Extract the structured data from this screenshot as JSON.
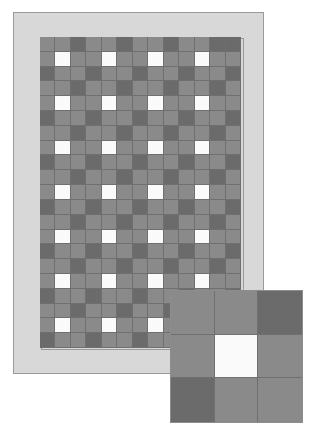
{
  "figure": {
    "kind": "quilt-pattern-diagram",
    "title": ""
  },
  "palette": {
    "border_fill": "#d8d8d8",
    "border_stroke": "#9a9a9a",
    "patch_mid": "#8a8a8a",
    "patch_dark": "#6b6b6b",
    "patch_light": "#fafafa",
    "seam_line": "#6f6f6f",
    "background": "#ffffff"
  },
  "quilt": {
    "name": "main-quilt",
    "columns": 13,
    "rows": 21,
    "border_width_px": 13,
    "cell_codes_legend": {
      "m": "mid-gray patch",
      "d": "dark-gray patch",
      "l": "light/white patch"
    },
    "grid": [
      "mmdmmdmmdmmdd",
      "mlmmlmmlmmlmm",
      "dmmdmmdmmdmmd",
      "mmdmmdmmdmmdm",
      "mlmmlmmlmmlmm",
      "dmmdmmdmmdmmd",
      "mmdmmdmmdmmdm",
      "mlmmlmmlmmlmm",
      "dmmdmmdmmdmmd",
      "mmdmmdmmdmmdm",
      "mlmmlmmlmmlmm",
      "dmmdmmdmmdmmd",
      "mmdmmdmmdmmdm",
      "mlmmlmmlmmlmm",
      "dmmdmmdmmdmmd",
      "mmdmmdmmdmmdm",
      "mlmmlmmlmmlmm",
      "dmmdmmdmmdmmd",
      "mmdmmdmmdmmdm",
      "mlmmlmmlmmlmm",
      "dmmdmmdmmdmmd"
    ]
  },
  "detail_inset": {
    "name": "block-detail",
    "columns": 3,
    "rows": 3,
    "grid": [
      "mmd",
      "mlm",
      "dmm"
    ]
  }
}
